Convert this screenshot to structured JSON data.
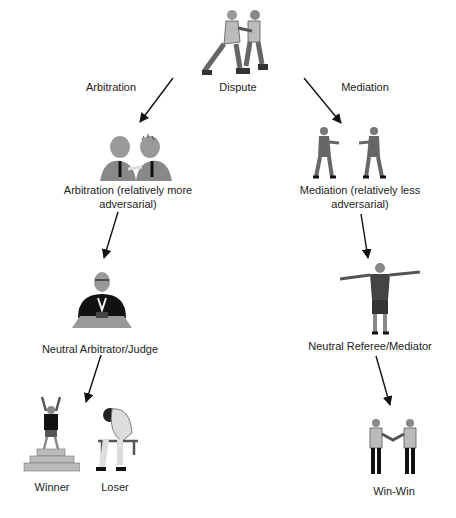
{
  "diagram": {
    "root": {
      "label": "Dispute",
      "icon": "boxers-fighting-icon"
    },
    "branches": [
      {
        "edge_label": "Arbitration",
        "stage1": {
          "label": "Arbitration (relatively more adversarial)",
          "icon": "arguing-men-icon"
        },
        "stage2": {
          "label": "Neutral Arbitrator/Judge",
          "icon": "judge-at-desk-icon"
        },
        "outcomes": [
          {
            "label": "Winner",
            "icon": "winner-on-podium-icon"
          },
          {
            "label": "Loser",
            "icon": "dejected-loser-icon"
          }
        ]
      },
      {
        "edge_label": "Mediation",
        "stage1": {
          "label": "Mediation (relatively less adversarial)",
          "icon": "men-confronting-icon"
        },
        "stage2": {
          "label": "Neutral Referee/Mediator",
          "icon": "referee-arms-out-icon"
        },
        "outcomes": [
          {
            "label": "Win-Win",
            "icon": "handshake-icon"
          }
        ]
      }
    ]
  },
  "colors": {
    "text": "#222222",
    "arrow": "#111111",
    "figure_dark": "#333333",
    "figure_mid": "#888888",
    "figure_light": "#bbbbbb"
  }
}
